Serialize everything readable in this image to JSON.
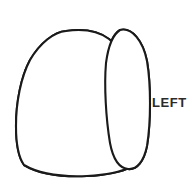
{
  "figure": {
    "kind": "anatomical-line-drawing",
    "side_label": "LEFT",
    "background_color": "#ffffff",
    "outline_color": "#1a1a1a",
    "fissure_color": "#2a2a2a",
    "stipple_color": "#555555",
    "stipple_fill_label": "stippled-segment",
    "canvas": {
      "width": 194,
      "height": 195
    }
  },
  "labels": {
    "left": "LEFT"
  },
  "regions": {
    "main_lobe": "main-lobe-body",
    "accessory_lobe": "narrow-posterior-lobe",
    "stippled_segment": "highlighted-segment-stippled",
    "hub": "fissure-convergence-point"
  }
}
